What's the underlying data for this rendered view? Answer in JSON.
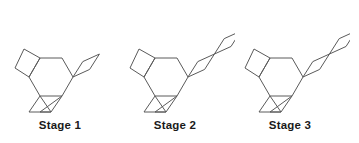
{
  "figure": {
    "type": "pattern-sequence",
    "background_color": "#ffffff",
    "stroke_color": "#5a5a5a",
    "label_color": "#1a1a1a",
    "stage_count": 3
  },
  "stages": [
    {
      "label": "Stage 1",
      "stage_number": 1,
      "rhombus_count": 1,
      "x_offset": 0,
      "shapes": {
        "hexagon": 1,
        "square": 1,
        "triangles": 2,
        "rhombi": 1
      }
    },
    {
      "label": "Stage 2",
      "stage_number": 2,
      "rhombus_count": 2,
      "x_offset": 115,
      "shapes": {
        "hexagon": 1,
        "square": 1,
        "triangles": 2,
        "rhombi": 2
      }
    },
    {
      "label": "Stage 3",
      "stage_number": 3,
      "rhombus_count": 3,
      "x_offset": 230,
      "shapes": {
        "hexagon": 1,
        "square": 1,
        "triangles": 2,
        "rhombi": 3
      }
    }
  ],
  "geometry": {
    "hexagon_points": "40,58 62,58 73,77 62,96 40,96 29,77",
    "square_points": "40,58 29,77 15,68 24,49",
    "triangle_left_points": "40,96 62,96 51,112",
    "triangle_right_points": "62,96 51,112 40,112",
    "triangle_left_alt": "40,96 51,112 29,112",
    "rhombus_unit": {
      "half_length": 17.5,
      "half_width": 5.2,
      "angle_deg": -41,
      "start_x": 73,
      "start_y": 77
    }
  }
}
